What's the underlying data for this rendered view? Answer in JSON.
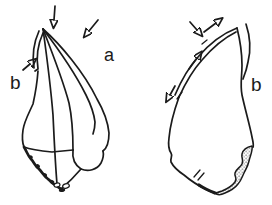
{
  "figure": {
    "colors": {
      "ink": "#1b1b1b",
      "background": "#ffffff"
    },
    "left_tool": {
      "labels": {
        "edge_a": "a",
        "edge_b": "b"
      },
      "arrows": [
        {
          "icon": "down-arrow-icon",
          "points_at": "tip"
        },
        {
          "icon": "down-left-arrow-icon",
          "points_at": "edge-a"
        },
        {
          "icon": "up-right-arrow-icon",
          "points_at": "edge-b"
        }
      ]
    },
    "right_tool": {
      "labels": {
        "edge_b": "b"
      },
      "arrows": [
        {
          "icon": "down-right-arrow-icon",
          "points_at": "upper-edge"
        },
        {
          "icon": "up-right-arrow-icon",
          "points_at": "upper-edge"
        },
        {
          "icon": "up-right-arrow-icon",
          "points_at": "mid-edge"
        },
        {
          "icon": "down-left-arrow-icon",
          "points_at": "lower-edge"
        }
      ]
    }
  }
}
